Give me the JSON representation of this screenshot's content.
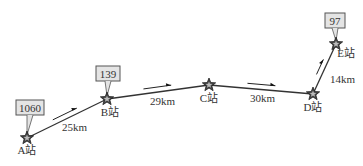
{
  "diagram": {
    "stations": [
      {
        "name": "A站",
        "x": 27,
        "y": 138,
        "label_dx": 0,
        "label_dy": 16,
        "count": "1060",
        "box": {
          "x": 16,
          "y": 100,
          "w": 28,
          "h": 15
        }
      },
      {
        "name": "B站",
        "x": 107,
        "y": 99,
        "label_dx": 3,
        "label_dy": 17,
        "count": "139",
        "box": {
          "x": 96,
          "y": 66,
          "w": 24,
          "h": 15
        }
      },
      {
        "name": "C站",
        "x": 209,
        "y": 85,
        "label_dx": 0,
        "label_dy": 17,
        "count": null,
        "box": null
      },
      {
        "name": "D站",
        "x": 313,
        "y": 94,
        "label_dx": 0,
        "label_dy": 17,
        "count": null,
        "box": null
      },
      {
        "name": "E站",
        "x": 336,
        "y": 44,
        "label_dx": 10,
        "label_dy": 13,
        "count": "97",
        "box": {
          "x": 325,
          "y": 13,
          "w": 20,
          "h": 15
        }
      }
    ],
    "segments": [
      {
        "from": 0,
        "to": 1,
        "distance": "25km",
        "label_x": 62,
        "label_y": 131
      },
      {
        "from": 1,
        "to": 2,
        "distance": "29km",
        "label_x": 150,
        "label_y": 105
      },
      {
        "from": 2,
        "to": 3,
        "distance": "30km",
        "label_x": 250,
        "label_y": 102
      },
      {
        "from": 3,
        "to": 4,
        "distance": "14km",
        "label_x": 330,
        "label_y": 83
      }
    ]
  }
}
